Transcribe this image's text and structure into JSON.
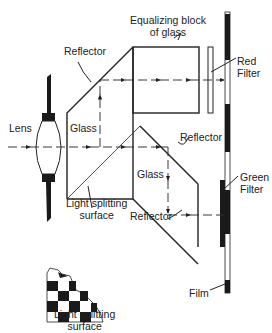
{
  "labels": {
    "equalizing_block": [
      "Equalizing block",
      "of glass"
    ],
    "reflector_top": "Reflector",
    "red_filter": [
      "Red",
      "Filter"
    ],
    "lens": "Lens",
    "glass_top": "Glass",
    "reflector_mid": "Reflector",
    "glass_bottom": "Glass",
    "light_splitting_surface": [
      "Light splitting",
      "surface"
    ],
    "green_filter": [
      "Green",
      "Filter"
    ],
    "reflector_bottom": "Reflector",
    "checker_caption": [
      "Light splitting",
      "surface"
    ],
    "film": "Film"
  },
  "colors": {
    "line": "#222222",
    "fill_dark": "#1a1a1a",
    "background": "#ffffff"
  }
}
